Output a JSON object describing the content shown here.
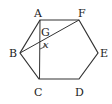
{
  "figure": {
    "type": "regular-hexagon",
    "stroke_color": "#333333",
    "vertices": [
      {
        "name": "A",
        "x": 40,
        "y": 20,
        "label_x": 34,
        "label_y": 17
      },
      {
        "name": "F",
        "x": 79,
        "y": 20,
        "label_x": 78,
        "label_y": 17
      },
      {
        "name": "E",
        "x": 98,
        "y": 53,
        "label_x": 100,
        "label_y": 57
      },
      {
        "name": "D",
        "x": 79,
        "y": 79,
        "label_x": 75,
        "label_y": 96
      },
      {
        "name": "C",
        "x": 39,
        "y": 79,
        "label_x": 34,
        "label_y": 96
      },
      {
        "name": "B",
        "x": 20,
        "y": 53,
        "label_x": 9,
        "label_y": 57
      }
    ],
    "segments": [
      {
        "from": "A",
        "to": "C"
      },
      {
        "from": "B",
        "to": "F"
      }
    ],
    "intersection": {
      "name": "G",
      "label_x": 41,
      "label_y": 36
    },
    "angle": {
      "label": "x",
      "label_x": 43,
      "label_y": 48
    }
  }
}
